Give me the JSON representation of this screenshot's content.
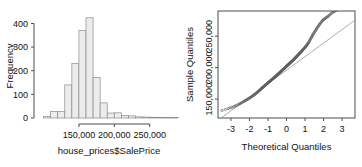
{
  "figure": {
    "panels": [
      "histogram",
      "qq-plot"
    ],
    "background": "#ffffff",
    "bar_fill": "#ececec",
    "bar_stroke": "#8c8c8c",
    "axis_color": "#4d4d4d",
    "point_color": "#5a5a5a",
    "refline_color": "#8a8a8a"
  },
  "chart_data": [
    {
      "type": "bar",
      "id": "histogram",
      "title": "",
      "xlabel": "house_prices$SalePrice",
      "ylabel": "Frequency",
      "xlim": [
        95000,
        290000
      ],
      "ylim": [
        0,
        440
      ],
      "grid": false,
      "legend": null,
      "xticklabels": [
        "150,000",
        "200,000",
        "250,000"
      ],
      "xtickvalues": [
        150000,
        200000,
        250000
      ],
      "yticklabels": [
        "0",
        "100",
        "200",
        "300",
        "400"
      ],
      "ytickvalues": [
        0,
        100,
        200,
        300,
        400
      ],
      "bin_width": 10000,
      "bin_starts": [
        100000,
        110000,
        120000,
        130000,
        140000,
        150000,
        160000,
        170000,
        180000,
        190000,
        200000,
        210000,
        220000,
        230000,
        240000,
        250000,
        260000,
        270000,
        280000
      ],
      "categories": [
        "100k",
        "110k",
        "120k",
        "130k",
        "140k",
        "150k",
        "160k",
        "170k",
        "180k",
        "190k",
        "200k",
        "210k",
        "220k",
        "230k",
        "240k",
        "250k",
        "260k",
        "270k",
        "280k"
      ],
      "values": [
        6,
        27,
        27,
        140,
        231,
        370,
        424,
        172,
        64,
        21,
        22,
        10,
        9,
        5,
        4,
        3,
        3,
        2,
        2
      ]
    },
    {
      "type": "scatter",
      "id": "qq-plot",
      "title": "",
      "xlabel": "Theoretical Quantiles",
      "ylabel": "Sample Quantiles",
      "xlim": [
        -3.7,
        3.7
      ],
      "ylim": [
        120000,
        290000
      ],
      "grid": false,
      "legend": null,
      "xticklabels": [
        "-3",
        "-2",
        "-1",
        "0",
        "1",
        "2",
        "3"
      ],
      "xtickvalues": [
        -3,
        -2,
        -1,
        0,
        1,
        2,
        3
      ],
      "yticklabels": [
        "150,000",
        "200,000",
        "250,000"
      ],
      "ytickvalues": [
        150000,
        200000,
        250000
      ],
      "reference_line": {
        "slope": 21500,
        "intercept": 196000
      },
      "series": [
        {
          "name": "Sample Quantiles",
          "x": [
            -3.48,
            -3.3,
            -3.15,
            -3.05,
            -2.95,
            -2.86,
            -2.78,
            -2.7,
            -2.63,
            -2.56,
            -2.5,
            -2.44,
            -2.38,
            -2.32,
            -2.27,
            -2.22,
            -2.17,
            -2.12,
            -2.08,
            -2.03,
            -1.99,
            -1.95,
            -1.91,
            -1.87,
            -1.83,
            -1.79,
            -1.76,
            -1.72,
            -1.69,
            -1.65,
            -1.62,
            -1.59,
            -1.56,
            -1.52,
            -1.49,
            -1.46,
            -1.43,
            -1.4,
            -1.37,
            -1.35,
            -1.32,
            -1.29,
            -1.26,
            -1.23,
            -1.21,
            -1.18,
            -1.15,
            -1.13,
            -1.1,
            -1.07,
            -1.05,
            -1.02,
            -1.0,
            -0.97,
            -0.95,
            -0.92,
            -0.9,
            -0.87,
            -0.85,
            -0.82,
            -0.8,
            -0.78,
            -0.75,
            -0.73,
            -0.7,
            -0.68,
            -0.66,
            -0.63,
            -0.61,
            -0.59,
            -0.57,
            -0.54,
            -0.52,
            -0.5,
            -0.48,
            -0.45,
            -0.43,
            -0.41,
            -0.39,
            -0.36,
            -0.34,
            -0.32,
            -0.3,
            -0.28,
            -0.25,
            -0.23,
            -0.21,
            -0.19,
            -0.17,
            -0.14,
            -0.12,
            -0.1,
            -0.08,
            -0.06,
            -0.04,
            -0.01,
            0.01,
            0.03,
            0.05,
            0.07,
            0.1,
            0.12,
            0.14,
            0.16,
            0.18,
            0.21,
            0.23,
            0.25,
            0.27,
            0.3,
            0.32,
            0.34,
            0.36,
            0.39,
            0.41,
            0.43,
            0.45,
            0.48,
            0.5,
            0.52,
            0.54,
            0.57,
            0.59,
            0.61,
            0.63,
            0.66,
            0.68,
            0.7,
            0.73,
            0.75,
            0.78,
            0.8,
            0.82,
            0.85,
            0.87,
            0.9,
            0.92,
            0.95,
            0.97,
            1.0,
            1.02,
            1.05,
            1.07,
            1.1,
            1.13,
            1.15,
            1.18,
            1.21,
            1.23,
            1.26,
            1.29,
            1.32,
            1.35,
            1.37,
            1.4,
            1.43,
            1.46,
            1.49,
            1.52,
            1.56,
            1.59,
            1.62,
            1.65,
            1.69,
            1.72,
            1.76,
            1.79,
            1.83,
            1.87,
            1.91,
            1.95,
            1.99,
            2.03,
            2.08,
            2.12,
            2.17,
            2.22,
            2.27,
            2.32,
            2.38,
            2.44,
            2.5,
            2.56,
            2.63,
            2.7,
            2.78,
            2.86,
            2.95,
            3.05,
            3.15,
            3.3,
            3.48
          ],
          "y": [
            132000,
            133500,
            135000,
            136000,
            137000,
            138000,
            139000,
            140000,
            141000,
            142000,
            143000,
            144000,
            145000,
            146000,
            147000,
            147800,
            148600,
            149400,
            150200,
            151000,
            151800,
            152600,
            153400,
            154200,
            155000,
            155800,
            156600,
            157400,
            158200,
            159000,
            159800,
            160600,
            161400,
            162200,
            163000,
            163800,
            164600,
            165400,
            166200,
            167000,
            167700,
            168400,
            169100,
            169800,
            170500,
            171200,
            171900,
            172600,
            173300,
            174000,
            174700,
            175400,
            176000,
            176600,
            177200,
            177800,
            178400,
            179000,
            179600,
            180200,
            180800,
            181400,
            182000,
            182600,
            183200,
            183800,
            184400,
            185000,
            185600,
            186200,
            186800,
            187400,
            188000,
            188600,
            189200,
            189800,
            190400,
            191000,
            191600,
            192200,
            192800,
            193400,
            194000,
            194600,
            195200,
            195800,
            196400,
            197000,
            197600,
            198200,
            198800,
            199400,
            200000,
            200600,
            201200,
            201800,
            202400,
            203000,
            203600,
            204200,
            204800,
            205400,
            206000,
            206600,
            207200,
            207800,
            208400,
            209000,
            209600,
            210200,
            210800,
            211400,
            212000,
            212700,
            213400,
            214100,
            214800,
            215500,
            216200,
            216900,
            217600,
            218300,
            219000,
            219700,
            220400,
            221100,
            221800,
            222500,
            223200,
            224000,
            224800,
            225600,
            226400,
            227200,
            228000,
            228800,
            229600,
            230400,
            231200,
            232000,
            233000,
            234000,
            235000,
            236000,
            237000,
            238000,
            239000,
            240500,
            242000,
            243500,
            245000,
            246500,
            248000,
            249500,
            251000,
            252500,
            254000,
            255500,
            257000,
            258500,
            260000,
            261500,
            263000,
            264500,
            266000,
            267500,
            269000,
            270500,
            272000,
            273500,
            275000,
            276000,
            277000,
            278000,
            279000,
            280000,
            281000,
            282000,
            283500,
            285000,
            286500,
            288000,
            289000,
            290000,
            291000,
            292000,
            293000
          ]
        }
      ]
    }
  ]
}
